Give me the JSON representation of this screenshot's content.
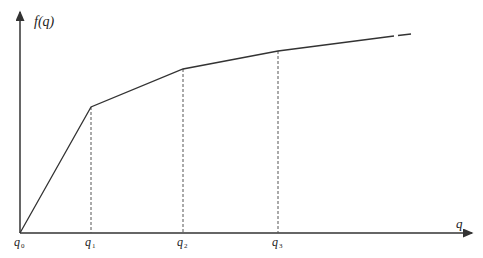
{
  "diagram": {
    "y_axis_label": "f(q)",
    "x_axis_label": "q",
    "colors": {
      "line": "#333333",
      "dashed": "#555555",
      "background": "#ffffff"
    },
    "ticks": [
      {
        "base": "q",
        "sub": "0"
      },
      {
        "base": "q",
        "sub": "1"
      },
      {
        "base": "q",
        "sub": "2"
      },
      {
        "base": "q",
        "sub": "3"
      }
    ],
    "polyline_points": [
      [
        20,
        233
      ],
      [
        91,
        107
      ],
      [
        183,
        69
      ],
      [
        278,
        51
      ],
      [
        411,
        34
      ]
    ]
  }
}
